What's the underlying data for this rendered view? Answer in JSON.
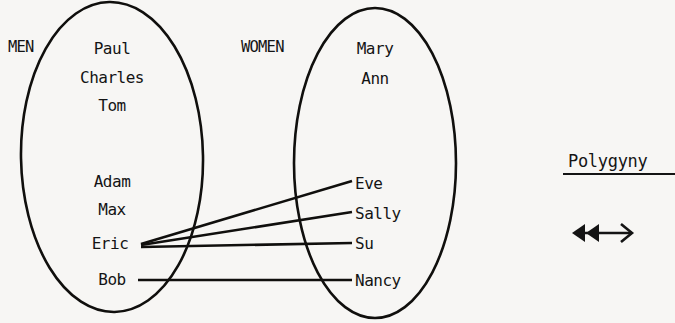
{
  "diagram": {
    "title_implied": "Polygyny kinship set diagram",
    "sets": [
      {
        "id": "men",
        "label": "MEN",
        "label_x": 8,
        "label_y": 52,
        "ellipse": {
          "cx": 112,
          "cy": 157,
          "rx": 91,
          "ry": 155
        },
        "members": [
          {
            "name": "Paul",
            "x": 112,
            "y": 54
          },
          {
            "name": "Charles",
            "x": 112,
            "y": 83
          },
          {
            "name": "Tom",
            "x": 112,
            "y": 111
          },
          {
            "name": "Adam",
            "x": 112,
            "y": 187
          },
          {
            "name": "Max",
            "x": 112,
            "y": 215
          },
          {
            "name": "Eric",
            "x": 110,
            "y": 249
          },
          {
            "name": "Bob",
            "x": 112,
            "y": 285
          }
        ]
      },
      {
        "id": "women",
        "label": "WOMEN",
        "label_x": 241,
        "label_y": 52,
        "ellipse": {
          "cx": 375,
          "cy": 163,
          "rx": 81,
          "ry": 155
        },
        "members": [
          {
            "name": "Mary",
            "x": 375,
            "y": 54
          },
          {
            "name": "Ann",
            "x": 375,
            "y": 84
          },
          {
            "name": "Eve",
            "x": 383,
            "y": 189
          },
          {
            "name": "Sally",
            "x": 393,
            "y": 219
          },
          {
            "name": "Su",
            "x": 375,
            "y": 249
          },
          {
            "name": "Nancy",
            "x": 393,
            "y": 286
          }
        ]
      }
    ],
    "links": [
      {
        "from": "Eric",
        "to": "Eve",
        "x1": 141,
        "y1": 244,
        "x2": 352,
        "y2": 181
      },
      {
        "from": "Eric",
        "to": "Sally",
        "x1": 141,
        "y1": 245,
        "x2": 352,
        "y2": 212
      },
      {
        "from": "Eric",
        "to": "Su",
        "x1": 141,
        "y1": 247,
        "x2": 352,
        "y2": 243
      },
      {
        "from": "Bob",
        "to": "Nancy",
        "x1": 138,
        "y1": 280,
        "x2": 352,
        "y2": 280
      }
    ]
  },
  "legend": {
    "title": "Polygyny",
    "title_x": 568,
    "title_y": 167,
    "rule": {
      "x1": 563,
      "y1": 173,
      "x2": 675,
      "y2": 173
    },
    "symbol_name": "double-left-arrowhead-to-open-right-arrow",
    "symbol": {
      "shaft_x1": 572,
      "shaft_x2": 632,
      "shaft_y": 233,
      "head_half_height": 9,
      "head_length": 12
    }
  },
  "colors": {
    "ink": "#141414",
    "stroke": "#100f0d",
    "paper": "#f7f6f4"
  }
}
